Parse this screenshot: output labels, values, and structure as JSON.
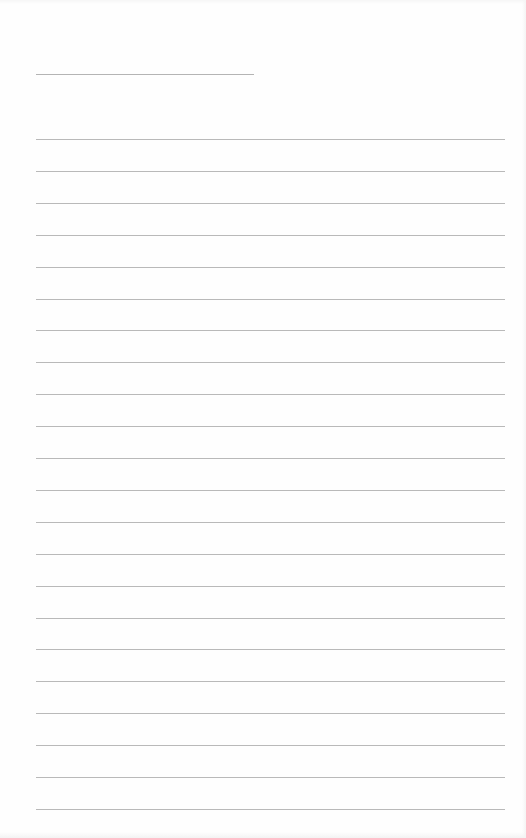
{
  "document": {
    "type": "lined-notebook-page",
    "content": "",
    "title_line": {
      "x": 36,
      "y": 74,
      "width": 218
    },
    "ruled_lines": {
      "count": 22,
      "first_y": 139,
      "spacing": 31.9,
      "x": 36,
      "width": 469
    },
    "colors": {
      "paper": "#fefefe",
      "line": "#b9b9b9"
    }
  }
}
